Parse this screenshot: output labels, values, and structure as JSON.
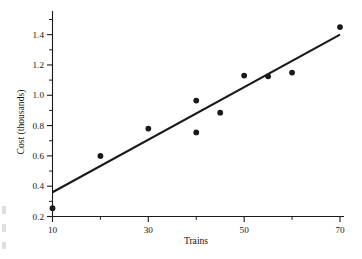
{
  "chart_data": {
    "type": "scatter",
    "title": "",
    "xlabel": "Trains",
    "ylabel": "Cost (thousands)",
    "xlim": [
      10,
      70
    ],
    "ylim": [
      0.2,
      1.5
    ],
    "grid": false,
    "legend": null,
    "x_ticks_major": [
      10,
      30,
      50,
      70
    ],
    "x_tick_labels": [
      "10",
      "30",
      "50",
      "70"
    ],
    "x_ticks_minor": [
      20,
      40,
      60
    ],
    "y_ticks_major": [
      0.2,
      0.4,
      0.6,
      0.8,
      1.0,
      1.2,
      1.4
    ],
    "y_tick_labels": [
      "0.2",
      "0.4",
      "0.6",
      "0.8",
      "1.0",
      "1.2",
      "1.4"
    ],
    "y_ticks_minor": [
      0.3,
      0.5,
      0.7,
      0.9,
      1.1,
      1.3,
      1.5
    ],
    "marker": "filled-circle",
    "marker_color": "#1a1a1a",
    "points": [
      {
        "x": 10,
        "y": 0.255
      },
      {
        "x": 20,
        "y": 0.6
      },
      {
        "x": 30,
        "y": 0.78
      },
      {
        "x": 40,
        "y": 0.965
      },
      {
        "x": 40,
        "y": 0.755
      },
      {
        "x": 45,
        "y": 0.885
      },
      {
        "x": 50,
        "y": 1.13
      },
      {
        "x": 55,
        "y": 1.125
      },
      {
        "x": 60,
        "y": 1.15
      },
      {
        "x": 70,
        "y": 1.45
      }
    ],
    "fit_line": {
      "name": "least-squares regression line",
      "color": "#1a1a1a",
      "x_start": 10,
      "y_start": 0.36,
      "x_end": 70,
      "y_end": 1.4,
      "slope": 0.01733,
      "intercept": 0.18667
    }
  },
  "edge_artifacts": [
    {
      "name": "page-edge-fragment-1",
      "x": 2,
      "y": 206,
      "w": 4,
      "h": 8
    },
    {
      "name": "page-edge-fragment-2",
      "x": 2,
      "y": 224,
      "w": 4,
      "h": 8
    },
    {
      "name": "page-edge-fragment-3",
      "x": 2,
      "y": 242,
      "w": 4,
      "h": 7
    }
  ]
}
